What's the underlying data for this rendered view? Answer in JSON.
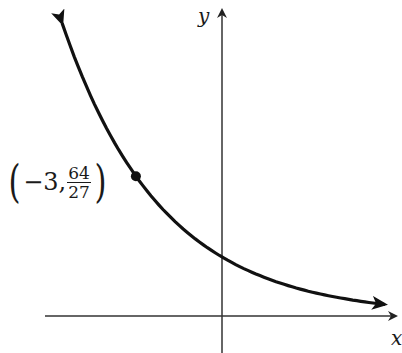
{
  "chart_data": {
    "type": "line",
    "title": "",
    "function": "y = (3/4)^x",
    "xlabel": "x",
    "ylabel": "y",
    "grid": false,
    "legend": null,
    "xlim": [
      -6,
      6
    ],
    "ylim": [
      -0.6,
      5.3
    ],
    "series": [
      {
        "name": "f(x) = (3/4)^x",
        "x": [
          -5.57,
          -5,
          -4,
          -3,
          -2,
          -1,
          0,
          1,
          2,
          3,
          4,
          5,
          5.68
        ],
        "y": [
          4.96,
          4.21,
          3.16,
          2.37,
          1.78,
          1.33,
          1.0,
          0.75,
          0.56,
          0.42,
          0.32,
          0.24,
          0.195
        ]
      }
    ],
    "annotations": [
      {
        "type": "point",
        "x": -3,
        "y": 2.37,
        "label": "(−3, 64/27)"
      }
    ],
    "arrows": {
      "curve_left_end": true,
      "curve_right_end": true,
      "x_axis_positive": true,
      "y_axis_positive": true
    }
  },
  "labels": {
    "y_axis": "y",
    "x_axis": "x",
    "point": {
      "open": "(",
      "x": "−3,",
      "num": "64",
      "den": "27",
      "close": ")"
    }
  },
  "colors": {
    "curve": "#1a1a1a",
    "axes": "#333333",
    "point": "#111111"
  }
}
